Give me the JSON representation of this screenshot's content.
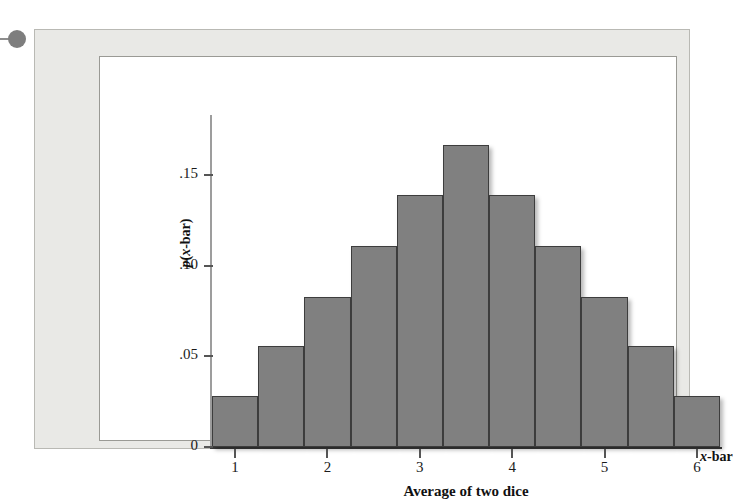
{
  "figure": {
    "axis_name_right": "x-bar",
    "decoration": {
      "bullet": "bullet-dot"
    }
  },
  "chart_data": {
    "type": "bar",
    "title": "",
    "subtitle": "",
    "xlabel": "Average of two dice",
    "ylabel": "p(x-bar)",
    "axis_name_right": "x-bar",
    "categories": [
      "1",
      "1.5",
      "2",
      "2.5",
      "3",
      "3.5",
      "4",
      "4.5",
      "5",
      "5.5",
      "6"
    ],
    "values": [
      0.028,
      0.056,
      0.083,
      0.111,
      0.139,
      0.167,
      0.139,
      0.111,
      0.083,
      0.056,
      0.028
    ],
    "value_fractions": [
      "1/36",
      "2/36",
      "3/36",
      "4/36",
      "5/36",
      "6/36",
      "5/36",
      "4/36",
      "3/36",
      "2/36",
      "1/36"
    ],
    "bar_width": 0.5,
    "xlim": [
      0.75,
      6.25
    ],
    "ylim": [
      0,
      0.1833
    ],
    "xticks": [
      1,
      2,
      3,
      4,
      5,
      6
    ],
    "xticklabels": [
      "1",
      "2",
      "3",
      "4",
      "5",
      "6"
    ],
    "yticks": [
      0,
      0.05,
      0.1,
      0.15
    ],
    "yticklabels": [
      "0",
      ".05",
      ".10",
      ".15"
    ],
    "grid": false,
    "legend": false,
    "bar_color": "#808080",
    "bar_edge_color": "#3d3d3d",
    "plot_background": "#ffffff",
    "frame_background": "#e9e9e6"
  }
}
